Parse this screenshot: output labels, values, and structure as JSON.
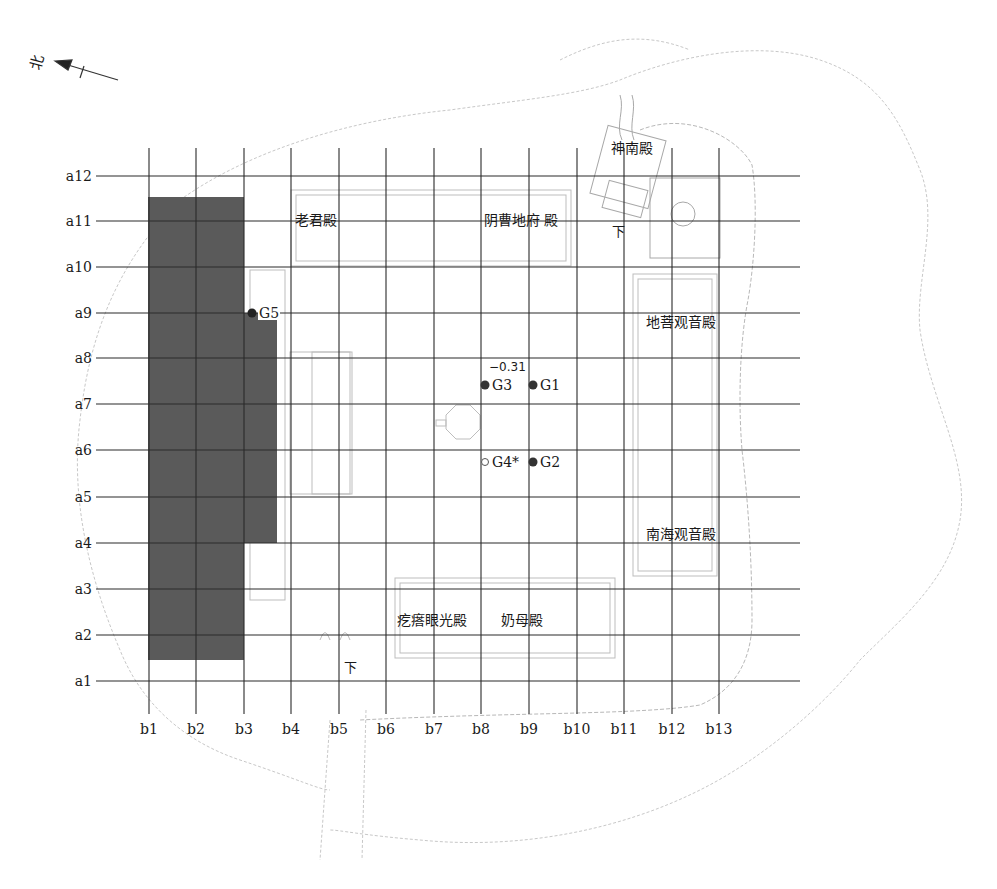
{
  "north_arrow": {
    "label": "北",
    "icon": "north-arrow-icon"
  },
  "grid": {
    "rows": [
      {
        "label": "a1",
        "y": 681
      },
      {
        "label": "a2",
        "y": 635
      },
      {
        "label": "a3",
        "y": 589
      },
      {
        "label": "a4",
        "y": 543
      },
      {
        "label": "a5",
        "y": 497
      },
      {
        "label": "a6",
        "y": 450
      },
      {
        "label": "a7",
        "y": 404
      },
      {
        "label": "a8",
        "y": 358
      },
      {
        "label": "a9",
        "y": 313
      },
      {
        "label": "a10",
        "y": 267
      },
      {
        "label": "a11",
        "y": 221
      },
      {
        "label": "a12",
        "y": 176
      }
    ],
    "cols": [
      {
        "label": "b1",
        "x": 149
      },
      {
        "label": "b2",
        "x": 196
      },
      {
        "label": "b3",
        "x": 244
      },
      {
        "label": "b4",
        "x": 291
      },
      {
        "label": "b5",
        "x": 339
      },
      {
        "label": "b6",
        "x": 386
      },
      {
        "label": "b7",
        "x": 434
      },
      {
        "label": "b8",
        "x": 481
      },
      {
        "label": "b9",
        "x": 529
      },
      {
        "label": "b10",
        "x": 577
      },
      {
        "label": "b11",
        "x": 624
      },
      {
        "label": "b12",
        "x": 672
      },
      {
        "label": "b13",
        "x": 719
      }
    ],
    "line_color": "#2a2a2a"
  },
  "excavated_area": {
    "color": "#5a5a5a",
    "extent": "b1–b3 / a2–a11, extension b3–b4 / a4–a9"
  },
  "halls": {
    "laojun": "老君殿",
    "yincao": "阴曹地府  殿",
    "shennan": "神南殿",
    "dipu": "地菩观音殿",
    "nanhai": "南海观音殿",
    "geda": "疙瘩眼光殿",
    "naimu": "奶母殿"
  },
  "stairs": {
    "down_1": "下",
    "down_2": "下"
  },
  "elevation": "−0.31",
  "points": {
    "g1": "G1",
    "g2": "G2",
    "g3": "G3",
    "g4": "G4*",
    "g5": "G5"
  }
}
